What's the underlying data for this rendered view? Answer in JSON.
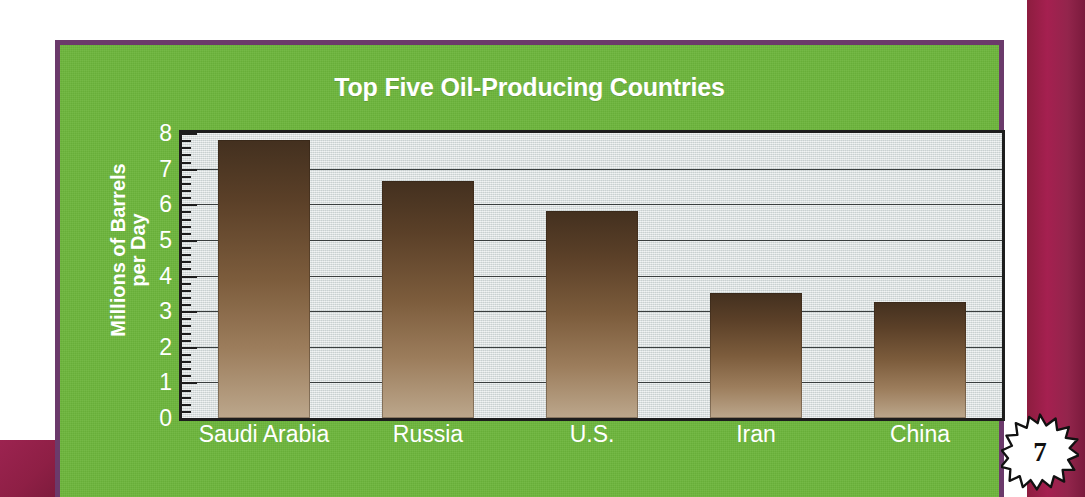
{
  "page": {
    "page_number": "7",
    "panel_color": "#6cb53b",
    "panel_border_color": "#6b3a6b",
    "accent_maroon": "#8d1d3f",
    "plot_background": "#d7dede",
    "bar_color_top": "#43301f",
    "bar_color_bottom": "#bca78c",
    "title_color": "#ffffff"
  },
  "chart_data": {
    "type": "bar",
    "title": "Top Five Oil-Producing Countries",
    "xlabel": "",
    "ylabel": "Millions of Barrels per Day",
    "ylabel_line1": "Millions of Barrels",
    "ylabel_line2": "per Day",
    "categories": [
      "Saudi Arabia",
      "Russia",
      "U.S.",
      "Iran",
      "China"
    ],
    "values": [
      7.8,
      6.65,
      5.8,
      3.5,
      3.25
    ],
    "ylim": [
      0,
      8
    ],
    "ytick_labels": [
      "0",
      "1",
      "2",
      "3",
      "4",
      "5",
      "6",
      "7",
      "8"
    ],
    "ytick_values": [
      0,
      1,
      2,
      3,
      4,
      5,
      6,
      7,
      8
    ],
    "minor_ticks_per_interval": 5,
    "grid": true,
    "grid_axis": "y",
    "legend": false,
    "legend_position": "none"
  }
}
